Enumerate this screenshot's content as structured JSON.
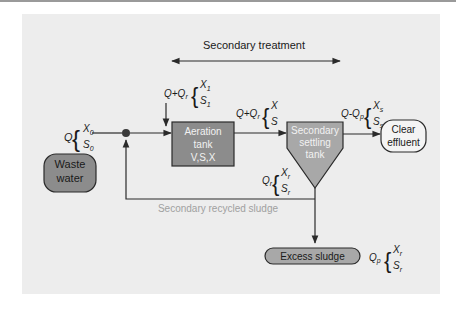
{
  "title": "Secondary treatment",
  "nodes": {
    "waste_water": [
      "Waste",
      "water"
    ],
    "aeration_tank": [
      "Aeration",
      "tank",
      "V,S,X"
    ],
    "settling_tank": [
      "Secondary",
      "settling",
      "tank"
    ],
    "clear_effluent": [
      "Clear",
      "effluent"
    ],
    "excess_sludge": "Excess sludge"
  },
  "recycle_label": "Secondary recycled sludge",
  "flows": {
    "influent": {
      "q": "Q",
      "x": "X",
      "x_sub": "0",
      "s": "S",
      "s_sub": "0"
    },
    "aeration_in": {
      "q": "Q+Q",
      "q_sub": "r",
      "x": "X",
      "x_sub": "1",
      "s": "S",
      "s_sub": "1"
    },
    "aeration_out": {
      "q": "Q+Q",
      "q_sub": "r",
      "x": "X",
      "s": "S"
    },
    "effluent": {
      "q": "Q-Q",
      "q_sub": "p",
      "x": "X",
      "x_sub": "s",
      "s": "S",
      "s_sub": "s"
    },
    "recycle": {
      "q": "Q",
      "q_sub": "r",
      "x": "X",
      "x_sub": "r",
      "s": "S",
      "s_sub": "r"
    },
    "purge": {
      "q": "Q",
      "q_sub": "p",
      "x": "X",
      "x_sub": "r",
      "s": "S",
      "s_sub": "r"
    }
  },
  "colors": {
    "background": "#ededed",
    "node_fill": "#8c8c8c",
    "pill_fill": "#a8a8a8",
    "line": "#2a2a2a",
    "recycle_text": "#a0a0a0"
  }
}
